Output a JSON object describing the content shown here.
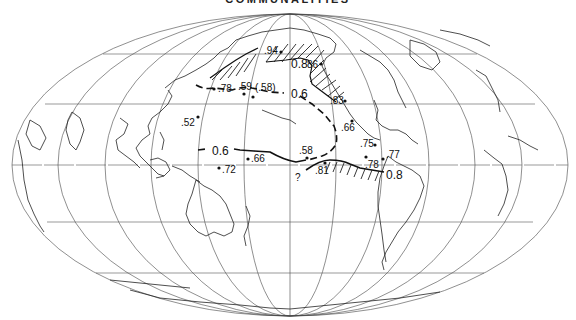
{
  "title": "COMMUNALITIES",
  "projection": "Mollweide (Pacific-centered)",
  "contours": [
    {
      "level": "0.6",
      "labels": [
        "0.6",
        "0.6",
        "0.6"
      ]
    },
    {
      "level": "0.8",
      "labels": [
        "0.8",
        "0.8"
      ]
    }
  ],
  "contour_labels": {
    "c06_north": "0.6",
    "c06_west": "0.6",
    "c08_north": "0.8",
    "c08_south": "0.8"
  },
  "points": [
    {
      "id": "p94",
      "label": ".94",
      "x": 255,
      "y": 50
    },
    {
      "id": "p86",
      "label": "86",
      "x": 321,
      "y": 63
    },
    {
      "id": "p78n",
      "label": ".78",
      "x": 214,
      "y": 89
    },
    {
      "id": "p59",
      "label": ".59",
      "x": 244,
      "y": 95
    },
    {
      "id": "p58p",
      "label": "(.58)",
      "x": 251,
      "y": 97
    },
    {
      "id": "p52",
      "label": ".52",
      "x": 198,
      "y": 117
    },
    {
      "id": "p83",
      "label": ".83",
      "x": 343,
      "y": 99
    },
    {
      "id": "p66e",
      "label": ".66",
      "x": 351,
      "y": 121
    },
    {
      "id": "p75",
      "label": ".75",
      "x": 375,
      "y": 145
    },
    {
      "id": "p77",
      "label": ".77",
      "x": 383,
      "y": 159
    },
    {
      "id": "p78s",
      "label": ".78",
      "x": 366,
      "y": 157
    },
    {
      "id": "p58",
      "label": ".58",
      "x": 306,
      "y": 158
    },
    {
      "id": "p81",
      "label": ".81",
      "x": 325,
      "y": 164
    },
    {
      "id": "p66w",
      "label": ".66",
      "x": 249,
      "y": 159
    },
    {
      "id": "p72",
      "label": ".72",
      "x": 219,
      "y": 169
    }
  ],
  "uncertain_marker": "?",
  "labels": {
    "p94": ".94",
    "p86": "86",
    "p78n": ".78",
    "p59": ".59",
    "p58p": "(.58)",
    "p52": ".52",
    "p83": ".83",
    "p66e": ".66",
    "p75": ".75",
    "p77": ".77",
    "p78s": ".78",
    "p58": ".58",
    "p81": ".81",
    "p66w": ".66",
    "p72": ".72",
    "question": "?"
  }
}
